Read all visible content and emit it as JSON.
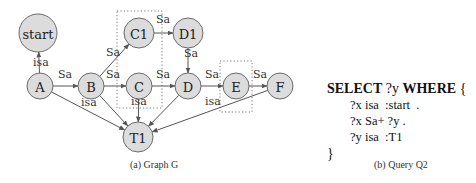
{
  "graph": {
    "nodes": [
      {
        "id": "start",
        "label": "start",
        "x": 38,
        "y": 33,
        "r": 19
      },
      {
        "id": "A",
        "label": "A",
        "x": 40,
        "y": 86,
        "r": 13
      },
      {
        "id": "B",
        "label": "B",
        "x": 91,
        "y": 86,
        "r": 13
      },
      {
        "id": "C1",
        "label": "C1",
        "x": 139,
        "y": 33,
        "r": 15
      },
      {
        "id": "C",
        "label": "C",
        "x": 139,
        "y": 86,
        "r": 13
      },
      {
        "id": "D1",
        "label": "D1",
        "x": 188,
        "y": 33,
        "r": 15
      },
      {
        "id": "D",
        "label": "D",
        "x": 188,
        "y": 86,
        "r": 13
      },
      {
        "id": "E",
        "label": "E",
        "x": 236,
        "y": 86,
        "r": 13
      },
      {
        "id": "F",
        "label": "F",
        "x": 280,
        "y": 86,
        "r": 13
      },
      {
        "id": "T1",
        "label": "T1",
        "x": 138,
        "y": 137,
        "r": 15
      }
    ],
    "edges": [
      {
        "from": "A",
        "to": "start",
        "label": "isa",
        "lx": 33,
        "ly": 66
      },
      {
        "from": "A",
        "to": "B",
        "label": "Sa",
        "lx": 58,
        "ly": 78
      },
      {
        "from": "A",
        "to": "T1",
        "label": "",
        "lx": 0,
        "ly": 0
      },
      {
        "from": "B",
        "to": "C1",
        "label": "Sa",
        "lx": 106,
        "ly": 56
      },
      {
        "from": "B",
        "to": "C",
        "label": "Sa",
        "lx": 106,
        "ly": 78
      },
      {
        "from": "B",
        "to": "T1",
        "label": "isa",
        "lx": 81,
        "ly": 106
      },
      {
        "from": "C1",
        "to": "D1",
        "label": "Sa",
        "lx": 156,
        "ly": 23
      },
      {
        "from": "C",
        "to": "D",
        "label": "Sa",
        "lx": 156,
        "ly": 78
      },
      {
        "from": "C",
        "to": "T1",
        "label": "isa",
        "lx": 131,
        "ly": 105
      },
      {
        "from": "D1",
        "to": "D",
        "label": "Sa",
        "lx": 184,
        "ly": 57
      },
      {
        "from": "D",
        "to": "E",
        "label": "Sa",
        "lx": 205,
        "ly": 78
      },
      {
        "from": "D",
        "to": "T1",
        "label": "",
        "lx": 0,
        "ly": 0
      },
      {
        "from": "E",
        "to": "F",
        "label": "Sa",
        "lx": 253,
        "ly": 78
      },
      {
        "from": "F",
        "to": "T1",
        "label": "isa",
        "lx": 205,
        "ly": 105
      }
    ],
    "boxes": [
      {
        "x": 117,
        "y": 11,
        "w": 45,
        "h": 97
      },
      {
        "x": 220,
        "y": 61,
        "w": 32,
        "h": 51
      }
    ],
    "caption": "(a) Graph G"
  },
  "query": {
    "line1_kw1": "SELECT",
    "line1_var": " ?y ",
    "line1_kw2": "WHERE",
    "line1_brace": " {",
    "triples": [
      "?x isa  :start  .",
      "?x Sa+ ?y .",
      "?y isa  :T1"
    ],
    "close": "}",
    "caption": "(b) Query Q2"
  }
}
